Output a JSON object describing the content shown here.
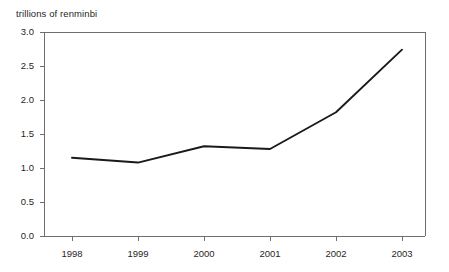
{
  "chart_data": {
    "type": "line",
    "title": "",
    "axis_note": "trillions of renminbi",
    "xlabel": "",
    "ylabel": "trillions of renminbi",
    "categories": [
      "1998",
      "1999",
      "2000",
      "2001",
      "2002",
      "2003"
    ],
    "x": [
      1998,
      1999,
      2000,
      2001,
      2002,
      2003
    ],
    "values": [
      1.15,
      1.08,
      1.32,
      1.28,
      1.82,
      2.74
    ],
    "series": [
      {
        "name": "trillions of renminbi",
        "values": [
          1.15,
          1.08,
          1.32,
          1.28,
          1.82,
          2.74
        ]
      }
    ],
    "ylim": [
      0.0,
      3.0
    ],
    "ytick_labels": [
      "0.0",
      "0.5",
      "1.0",
      "1.5",
      "2.0",
      "2.5",
      "3.0"
    ],
    "ytick_values": [
      0.0,
      0.5,
      1.0,
      1.5,
      2.0,
      2.5,
      3.0
    ],
    "xtick_labels": [
      "1998",
      "1999",
      "2000",
      "2001",
      "2002",
      "2003"
    ],
    "grid": false,
    "legend": false,
    "legend_position": "none",
    "line_color": "#1a1a1a",
    "axis_color": "#6e6e6e",
    "background_color": "#ffffff"
  }
}
